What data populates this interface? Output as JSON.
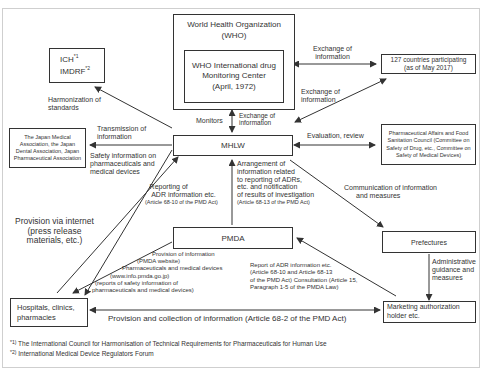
{
  "nodes": {
    "who": {
      "title": "World Health Organization",
      "abbr": "(WHO)"
    },
    "who_center": {
      "line1": "WHO International drug",
      "line2": "Monitoring Center",
      "line3": "(April, 1972)"
    },
    "ich": {
      "line1": "ICH",
      "sup1": "*1",
      "line2": "IMDRF",
      "sup2": "*2"
    },
    "countries": {
      "line1": "127 countries participating",
      "line2": "(as of May 2017)"
    },
    "associations": {
      "line1": "The Japan Medical",
      "line2": "Association, the Japan",
      "line3": "Dental Association, Japan",
      "line4": "Pharmaceutical Association"
    },
    "mhlw": {
      "label": "MHLW"
    },
    "council": {
      "line1": "Pharmaceutical Affairs and Food",
      "line2": "Sanitation Council (Committee on",
      "line3": "Safety of Drug, etc., Committee on",
      "line4": "Safety of Medical Devices)"
    },
    "pmda": {
      "label": "PMDA"
    },
    "prefectures": {
      "label": "Prefectures"
    },
    "hospitals": {
      "line1": "Hospitals, clinics,",
      "line2": "pharmacies"
    },
    "mah": {
      "line1": "Marketing authorization",
      "line2": "holder etc."
    }
  },
  "edges": {
    "who_countries": {
      "line1": "Exchange of",
      "line2": "information"
    },
    "mhlw_countries": {
      "line1": "Exchange of",
      "line2": "information"
    },
    "monitors": "Monitors",
    "mhlw_who": {
      "line1": "Exchange of",
      "line2": "information"
    },
    "harmonization": {
      "line1": "Harmonization of",
      "line2": "standards"
    },
    "transmission": {
      "line1": "Transmission of",
      "line2": "information"
    },
    "safety_info": {
      "line1": "Safety information on",
      "line2": "pharmaceuticals and",
      "line3": "medical devices"
    },
    "evaluation": "Evaluation, review",
    "adr_reporting": {
      "line1": "Reporting of",
      "line2": "ADR information etc.",
      "line3": "(Article 68-10 of the PMD Act)"
    },
    "arrangement": {
      "line1": "Arrangement of",
      "line2": "information related",
      "line3": "to reporting of ADRs,",
      "line4": "etc. and notification",
      "line5": "of results of investigation",
      "line6": "(Article 68-13 of the PMD Act)"
    },
    "communication": {
      "line1": "Communication of information",
      "line2": "and measures"
    },
    "internet": {
      "line1": "Provision via internet",
      "line2": "(press release",
      "line3": "materials, etc.)"
    },
    "pmda_provision": {
      "line1": "Provision of information",
      "line2": "(PMDA website)",
      "line3": "Pharmaceuticals and medical devices",
      "line4": "(www.info.pmda.go.jp)",
      "line5": "(reports of safety information of",
      "line6": "pharmaceuticals and medical devices)"
    },
    "mah_report": {
      "line1": "Report of ADR information etc.",
      "line2": "(Article 68-10 and Article 68-13",
      "line3": "of the PMD Act) Consultation (Article 15,",
      "line4": "Paragraph 1-5 of the PMDA Law)"
    },
    "admin_guidance": {
      "line1": "Administrative",
      "line2": "guidance and",
      "line3": "measures"
    },
    "provision_collection": "Provision and collection of information (Article 68-2 of the PMD Act)"
  },
  "footnotes": [
    {
      "mark": "*1)",
      "text": "The International Council for Harmonisation of Technical Requirements for Pharmaceuticals for Human Use"
    },
    {
      "mark": "*2)",
      "text": "International Medical Device Regulators Forum"
    }
  ],
  "colors": {
    "line": "#333333",
    "text": "#333333",
    "frame": "#cfcfcf"
  }
}
